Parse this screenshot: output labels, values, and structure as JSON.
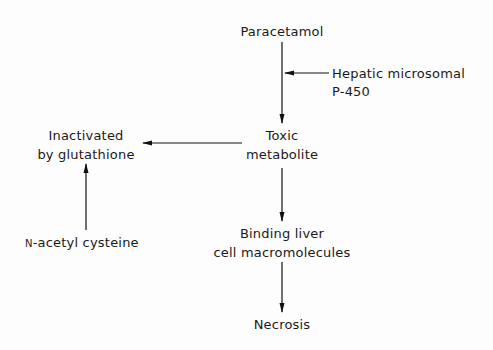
{
  "diagram": {
    "nodes": {
      "paracetamol": "Paracetamol",
      "hepatic_line1": "Hepatic microsomal",
      "hepatic_line2": "P-450",
      "toxic_line1": "Toxic",
      "toxic_line2": "metabolite",
      "inactivated_line1": "Inactivated",
      "inactivated_line2": "by glutathione",
      "nac_prefix": "N",
      "nac_rest": "-acetyl cysteine",
      "binding_line1": "Binding liver",
      "binding_line2": "cell macromolecules",
      "necrosis": "Necrosis"
    },
    "edges": [
      {
        "from": "Paracetamol",
        "to": "Toxic metabolite"
      },
      {
        "from": "Hepatic microsomal P-450",
        "to": "Paracetamol→Toxic metabolite edge"
      },
      {
        "from": "Toxic metabolite",
        "to": "Inactivated by glutathione"
      },
      {
        "from": "N-acetyl cysteine",
        "to": "Inactivated by glutathione"
      },
      {
        "from": "Toxic metabolite",
        "to": "Binding liver cell macromolecules"
      },
      {
        "from": "Binding liver cell macromolecules",
        "to": "Necrosis"
      }
    ]
  }
}
